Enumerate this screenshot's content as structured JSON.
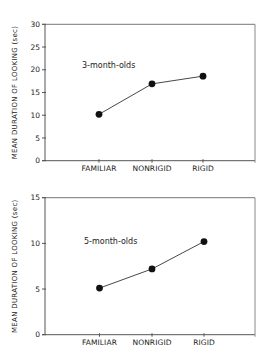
{
  "chart_data": [
    {
      "type": "line",
      "title": "3-month-olds",
      "annotation": "3-month-olds",
      "xlabel": "",
      "ylabel": "MEAN DURATION OF LOOKING (sec)",
      "categories": [
        "FAMILIAR",
        "NONRIGID",
        "RIGID"
      ],
      "values": [
        10.2,
        16.9,
        18.6
      ],
      "ylim": [
        0,
        30
      ],
      "yticks": [
        0,
        5,
        10,
        15,
        20,
        25,
        30
      ],
      "grid": false,
      "legend": null,
      "marker": "filled-circle",
      "color": "#111111"
    },
    {
      "type": "line",
      "title": "5-month-olds",
      "annotation": "5-month-olds",
      "xlabel": "",
      "ylabel": "MEAN DURATION OF LOOKING (sec)",
      "categories": [
        "FAMILIAR",
        "NONRIGID",
        "RIGID"
      ],
      "values": [
        5.1,
        7.2,
        10.2
      ],
      "ylim": [
        0,
        15
      ],
      "yticks": [
        0,
        5,
        10,
        15
      ],
      "grid": false,
      "legend": null,
      "marker": "filled-circle",
      "color": "#111111"
    }
  ]
}
